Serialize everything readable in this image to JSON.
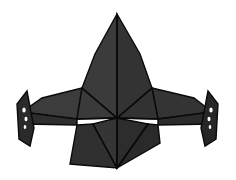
{
  "image": {
    "title": "Low-poly origami spacecraft silhouette",
    "subject": "bird-of-prey style faceted starship, front view",
    "background_color": "#ffffff",
    "width": 236,
    "height": 180
  },
  "palette": {
    "background": "#ffffff",
    "crease_line": "#0a0a0a",
    "dorsal_fin_left": "#3b3b3b",
    "dorsal_fin_right": "#333333",
    "body_left": "#3a3a3a",
    "body_right": "#323232",
    "wing_left_upper": "#3c3c3c",
    "wing_right_upper": "#343434",
    "wing_left_bar": "#2e2e2e",
    "wing_right_bar": "#2b2b2b",
    "wingtip_left": "#2a2a2a",
    "wingtip_right": "#262626",
    "tail_left": "#303030",
    "tail_right": "#2a2a2a",
    "tail_center_left": "#353535",
    "tail_center_right": "#2d2d2d",
    "hole_fill": "#ffffff"
  },
  "geometry": {
    "center_vertex": {
      "x": 117,
      "y": 118
    },
    "dorsal_apex": {
      "x": 117,
      "y": 14
    },
    "span_left_x": 17,
    "span_right_x": 219,
    "tail_bottom_y": 168
  },
  "parts": {
    "dorsal_fin_left_label": "dorsal-fin-left-facet",
    "dorsal_fin_right_label": "dorsal-fin-right-facet",
    "body_left_label": "body-left-facet",
    "body_right_label": "body-right-facet",
    "wing_left_label": "wing-left-upper-facet",
    "wing_right_label": "wing-right-upper-facet",
    "wing_left_bar_label": "wing-left-lower-bar",
    "wing_right_bar_label": "wing-right-lower-bar",
    "wingtip_left_label": "wingtip-left-fin",
    "wingtip_right_label": "wingtip-right-fin",
    "tail_left_label": "tail-left-facet",
    "tail_right_label": "tail-right-facet",
    "tail_center_left_label": "tail-center-left-facet",
    "tail_center_right_label": "tail-center-right-facet"
  },
  "paths": {
    "dorsal_fin_left": "117,14 117,118 82,88 95,54",
    "dorsal_fin_right": "117,14 140,54 152,88 117,118",
    "body_left": "82,88 117,118 77,119",
    "body_right": "152,88 158,119 117,118",
    "wing_left_upper": "82,88 77,119 22,112 42,98",
    "wing_right_upper": "152,88 194,98 212,112 158,119",
    "wing_left_bar": "22,112 77,119 77,125 23,124",
    "wing_right_bar": "158,119 212,112 213,124 158,125",
    "wingtip_left": "27,91 34,128 30,146 19,139 17,104",
    "wingtip_right": "208,91 218,104 216,139 205,146 201,128",
    "tail_center_left": "117,118 117,168 93,124",
    "tail_center_right": "117,118 148,124 117,168",
    "tail_left": "77,125 93,124 117,168 70,164",
    "tail_right": "148,124 158,125 160,143 117,168",
    "fin_holes_left": [
      {
        "cx": 24,
        "cy": 110,
        "rx": 1.7,
        "ry": 2.6
      },
      {
        "cx": 26,
        "cy": 119,
        "rx": 1.5,
        "ry": 2.3
      },
      {
        "cx": 25,
        "cy": 127,
        "rx": 1.3,
        "ry": 2.0
      }
    ],
    "fin_holes_right": [
      {
        "cx": 211,
        "cy": 110,
        "rx": 1.7,
        "ry": 2.6
      },
      {
        "cx": 209,
        "cy": 119,
        "rx": 1.5,
        "ry": 2.3
      },
      {
        "cx": 210,
        "cy": 127,
        "rx": 1.3,
        "ry": 2.0
      }
    ],
    "creases": [
      "M117,14 L117,168",
      "M82,88 L117,118",
      "M152,88 L117,118",
      "M77,119 L117,118",
      "M158,119 L117,118",
      "M93,124 L117,168",
      "M148,124 L117,168"
    ]
  }
}
